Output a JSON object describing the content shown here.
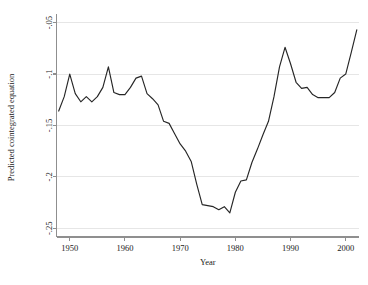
{
  "chart_data": {
    "type": "line",
    "title": "",
    "subtitle": "",
    "xlabel": "Year",
    "ylabel": "Predicted cointegrated equation",
    "xlim": [
      1947.6,
      2002.4
    ],
    "ylim": [
      -0.2585,
      -0.0455
    ],
    "grid": true,
    "grid_axis": "y",
    "legend": false,
    "legend_position": "none",
    "xticks": [
      1950,
      1960,
      1970,
      1980,
      1990,
      2000
    ],
    "xtick_labels": [
      "1950",
      "1960",
      "1970",
      "1980",
      "1990",
      "2000"
    ],
    "yticks": [
      -0.05,
      -0.1,
      -0.15,
      -0.2,
      -0.25
    ],
    "ytick_labels": [
      "-.05",
      "-.1",
      "-.15",
      "-.2",
      "-.25"
    ],
    "line_color": "#262626",
    "series": [
      {
        "name": "Predicted cointegrated equation",
        "x": [
          1948,
          1949,
          1950,
          1951,
          1952,
          1953,
          1954,
          1955,
          1956,
          1957,
          1958,
          1959,
          1960,
          1961,
          1962,
          1963,
          1964,
          1965,
          1966,
          1967,
          1968,
          1969,
          1970,
          1971,
          1972,
          1973,
          1974,
          1975,
          1976,
          1977,
          1978,
          1979,
          1980,
          1981,
          1982,
          1983,
          1984,
          1985,
          1986,
          1987,
          1988,
          1989,
          1990,
          1991,
          1992,
          1993,
          1994,
          1995,
          1996,
          1997,
          1998,
          1999,
          2000,
          2001,
          2002
        ],
        "values": [
          -0.136,
          -0.122,
          -0.1,
          -0.119,
          -0.127,
          -0.122,
          -0.127,
          -0.122,
          -0.113,
          -0.093,
          -0.118,
          -0.12,
          -0.12,
          -0.113,
          -0.104,
          -0.102,
          -0.119,
          -0.124,
          -0.13,
          -0.146,
          -0.148,
          -0.158,
          -0.168,
          -0.175,
          -0.185,
          -0.207,
          -0.227,
          -0.228,
          -0.229,
          -0.232,
          -0.229,
          -0.235,
          -0.215,
          -0.204,
          -0.203,
          -0.186,
          -0.173,
          -0.159,
          -0.146,
          -0.122,
          -0.093,
          -0.074,
          -0.09,
          -0.108,
          -0.114,
          -0.113,
          -0.12,
          -0.123,
          -0.123,
          -0.123,
          -0.118,
          -0.104,
          -0.1,
          -0.079,
          -0.057
        ]
      }
    ]
  }
}
